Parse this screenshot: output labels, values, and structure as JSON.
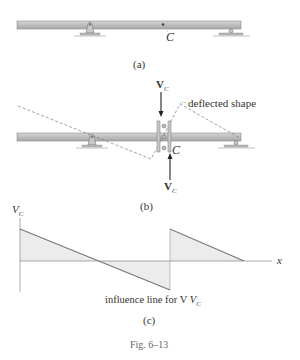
{
  "figure": {
    "caption": "Fig. 6–13",
    "panels": {
      "a": {
        "label": "(a)",
        "point_label": "C"
      },
      "b": {
        "label": "(b)",
        "point_label": "C",
        "annotation": "deflected shape",
        "force_top": "V",
        "force_top_sub": "C",
        "force_bottom": "V",
        "force_bottom_sub": "C"
      },
      "c": {
        "label": "(c)",
        "y_axis_label": "V",
        "y_axis_sub": "C",
        "x_axis_label": "x",
        "curve_caption": "influence line for V",
        "curve_caption_sub": "C"
      }
    }
  },
  "colors": {
    "beam_fill": "#b9b9b9",
    "beam_edge": "#8a8a8a",
    "line": "#7a7a7a",
    "shade": "#ececec",
    "text": "#333333"
  }
}
